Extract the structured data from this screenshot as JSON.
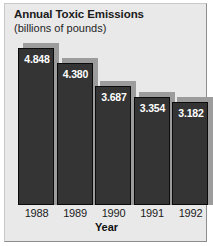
{
  "chart_data": {
    "type": "bar",
    "title": "Annual Toxic Emissions",
    "subtitle": "(billions of pounds)",
    "xlabel": "Year",
    "ylabel": "",
    "categories": [
      "1988",
      "1989",
      "1990",
      "1991",
      "1992"
    ],
    "values": [
      4.848,
      4.38,
      3.687,
      3.354,
      3.182
    ],
    "value_labels": [
      "4.848",
      "4.380",
      "3.687",
      "3.354",
      "3.182"
    ],
    "ylim": [
      0,
      5.2
    ],
    "grid": false,
    "legend": false,
    "colors": {
      "background": "#e9e9e9",
      "bar_fill": "#343434",
      "bar_outline": "#0b0b0b",
      "bar_shadow": "#9c9c9c",
      "value_text": "#ffffff",
      "axis_text": "#1b1b1b"
    }
  }
}
